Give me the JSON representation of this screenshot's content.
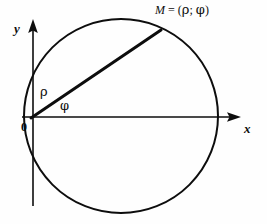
{
  "figure": {
    "kind": "polar-coordinates-diagram",
    "background_color": "#fefefe",
    "stroke_color": "#0d0d0d"
  },
  "labels": {
    "y_axis": "y",
    "x_axis": "x",
    "origin": "0",
    "rho": "ρ",
    "phi": "φ",
    "point_m_symbol": "M",
    "point_m_equals": " = (",
    "point_m_rho": "ρ",
    "point_m_separator": "; ",
    "point_m_phi": "φ",
    "point_m_close": ")",
    "point_m_full": "M = (ρ; φ)"
  },
  "geometry": {
    "origin": {
      "x": 31,
      "y": 118
    },
    "circle": {
      "cx": 121,
      "cy": 116,
      "r": 97,
      "stroke_width": 2
    },
    "point_m": {
      "x": 161,
      "y": 30
    },
    "radius_vector": {
      "x1": 31,
      "y1": 118,
      "x2": 161,
      "y2": 30,
      "stroke_width": 3
    },
    "x_axis": {
      "x1": 22,
      "y1": 117,
      "x2": 241,
      "y2": 117,
      "stroke_width": 1.6
    },
    "y_axis": {
      "x1": 33,
      "y1": 206,
      "x2": 33,
      "y2": 19,
      "stroke_width": 1.6
    },
    "x_arrow_tip": {
      "x": 241,
      "y": 117
    },
    "y_arrow_tip": {
      "x": 33,
      "y": 19
    }
  },
  "icons": {
    "x_axis_arrowhead": "arrow-right-icon",
    "y_axis_arrowhead": "arrow-up-icon"
  }
}
